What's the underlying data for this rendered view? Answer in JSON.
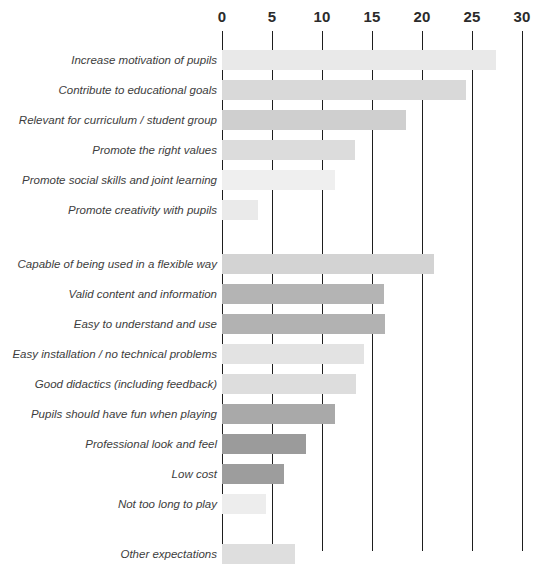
{
  "chart_data": {
    "type": "bar",
    "orientation": "horizontal",
    "title": "",
    "subtitle": "",
    "xlabel": "",
    "ylabel": "",
    "xlim": [
      0,
      30
    ],
    "ylim": null,
    "grid": true,
    "gridline_axis": "x",
    "legend": false,
    "legend_position": "none",
    "axis_position": "top",
    "tick_labels": [
      "0",
      "5",
      "10",
      "15",
      "20",
      "25",
      "30"
    ],
    "tick_values": [
      0,
      5,
      10,
      15,
      20,
      25,
      30
    ],
    "categories": [
      "Increase motivation of pupils",
      "Contribute to educational goals",
      "Relevant for curriculum / student group",
      "Promote the right values",
      "Promote social skills and joint learning",
      "Promote creativity with pupils",
      "Capable of being used in a flexible way",
      "Valid content and information",
      "Easy to understand and use",
      "Easy installation / no technical problems",
      "Good didactics (including feedback)",
      "Pupils should have fun when playing",
      "Professional look and feel",
      "Low cost",
      "Not too long to play",
      "Other expectations"
    ],
    "values": [
      27.4,
      24.4,
      18.4,
      13.3,
      11.3,
      3.6,
      21.2,
      16.2,
      16.3,
      14.2,
      13.4,
      11.3,
      8.4,
      6.2,
      4.4,
      7.3
    ],
    "bar_colors": [
      "#e9e9e9",
      "#d9d9d9",
      "#cfcfcf",
      "#dcdcdc",
      "#efefef",
      "#eaeaea",
      "#d3d3d3",
      "#b4b4b4",
      "#b2b2b2",
      "#e3e3e3",
      "#dddddd",
      "#a9a9a9",
      "#9b9b9b",
      "#9d9d9d",
      "#ededed",
      "#dedede"
    ],
    "row_groups": [
      {
        "name": "group-1",
        "rows": [
          0,
          1,
          2,
          3,
          4,
          5
        ]
      },
      {
        "name": "group-2",
        "rows": [
          6,
          7,
          8,
          9,
          10,
          11,
          12,
          13,
          14
        ]
      },
      {
        "name": "group-3",
        "rows": [
          15
        ]
      }
    ],
    "colors": {
      "gridline": "#1e1e1e",
      "tick_label": "#2b2b2b",
      "category_label": "#3d3d3d",
      "background": "#ffffff"
    }
  },
  "layout": {
    "plot_left_px": 222,
    "plot_right_px": 521,
    "px_per_unit": 10,
    "row_pitch_px": 30,
    "bar_height_px": 20,
    "row_tops_px": [
      14,
      44,
      74,
      104,
      134,
      164,
      218,
      248,
      278,
      308,
      338,
      368,
      398,
      428,
      458,
      508
    ]
  }
}
